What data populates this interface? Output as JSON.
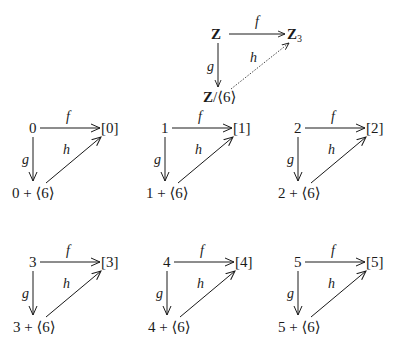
{
  "main_diagram": {
    "nodes": {
      "source": "Z",
      "target": "Z",
      "target_sub": "3",
      "quotient_main": "Z",
      "quotient_rest": "/⟨6⟩"
    },
    "arrows": {
      "f": "f",
      "g": "g",
      "h": "h"
    }
  },
  "instances": [
    {
      "source": "0",
      "target": "[0]",
      "coset": "0 + ⟨6⟩",
      "f": "f",
      "g": "g",
      "h": "h"
    },
    {
      "source": "1",
      "target": "[1]",
      "coset": "1 + ⟨6⟩",
      "f": "f",
      "g": "g",
      "h": "h"
    },
    {
      "source": "2",
      "target": "[2]",
      "coset": "2 + ⟨6⟩",
      "f": "f",
      "g": "g",
      "h": "h"
    },
    {
      "source": "3",
      "target": "[3]",
      "coset": "3 + ⟨6⟩",
      "f": "f",
      "g": "g",
      "h": "h"
    },
    {
      "source": "4",
      "target": "[4]",
      "coset": "4 + ⟨6⟩",
      "f": "f",
      "g": "g",
      "h": "h"
    },
    {
      "source": "5",
      "target": "[5]",
      "coset": "5 + ⟨6⟩",
      "f": "f",
      "g": "g",
      "h": "h"
    }
  ]
}
